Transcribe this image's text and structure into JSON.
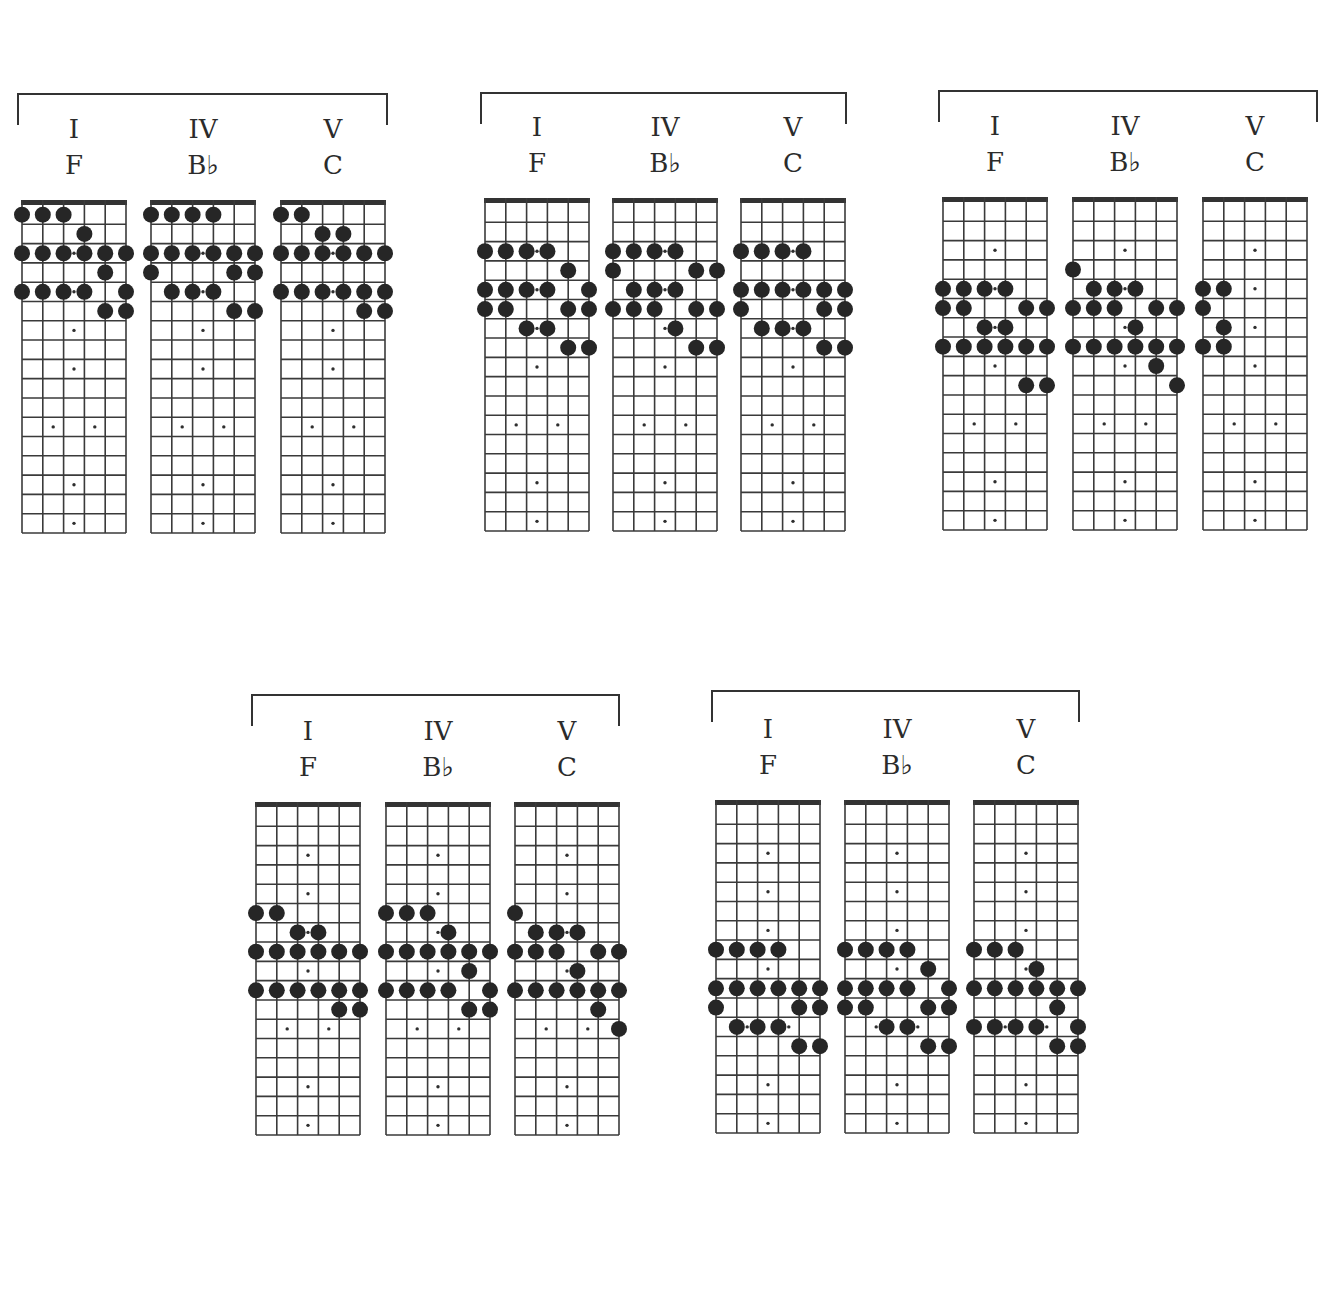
{
  "fretboard": {
    "strings": 6,
    "frets": 17,
    "inlays_single": [
      3,
      5,
      7,
      9,
      15,
      17
    ],
    "inlays_double": [
      12
    ]
  },
  "groups": [
    {
      "id": "g1",
      "x": 17,
      "y": 93,
      "w": 371,
      "boardTop": 200,
      "boardX": [
        22,
        151,
        281
      ],
      "chords": [
        {
          "numeral": "I",
          "name": "F",
          "dots": {
            "1": [
              1,
              2,
              3
            ],
            "2": [
              4
            ],
            "3": [
              1,
              2,
              3,
              4,
              5,
              6
            ],
            "4": [
              5
            ],
            "5": [
              1,
              2,
              3,
              4,
              6
            ],
            "6": [
              5,
              6
            ]
          }
        },
        {
          "numeral": "IV",
          "name": "B♭",
          "dots": {
            "1": [
              1,
              2,
              3,
              4
            ],
            "3": [
              1,
              2,
              3,
              4,
              5,
              6
            ],
            "4": [
              1,
              5,
              6
            ],
            "5": [
              2,
              3,
              4
            ],
            "6": [
              5,
              6
            ]
          }
        },
        {
          "numeral": "V",
          "name": "C",
          "dots": {
            "1": [
              1,
              2
            ],
            "2": [
              3,
              4
            ],
            "3": [
              1,
              2,
              3,
              4,
              5,
              6
            ],
            "5": [
              1,
              2,
              3,
              4,
              5,
              6
            ],
            "6": [
              5,
              6
            ]
          }
        }
      ]
    },
    {
      "id": "g2",
      "x": 480,
      "y": 92,
      "w": 367,
      "boardTop": 198,
      "boardX": [
        485,
        613,
        741
      ],
      "chords": [
        {
          "numeral": "I",
          "name": "F",
          "dots": {
            "3": [
              1,
              2,
              3,
              4
            ],
            "4": [
              5
            ],
            "5": [
              1,
              2,
              3,
              4,
              6
            ],
            "6": [
              1,
              2,
              5,
              6
            ],
            "7": [
              3,
              4
            ],
            "8": [
              5,
              6
            ]
          }
        },
        {
          "numeral": "IV",
          "name": "B♭",
          "dots": {
            "3": [
              1,
              2,
              3,
              4
            ],
            "4": [
              1,
              5,
              6
            ],
            "5": [
              2,
              3,
              4
            ],
            "6": [
              1,
              2,
              3,
              5,
              6
            ],
            "7": [
              4
            ],
            "8": [
              5,
              6
            ]
          }
        },
        {
          "numeral": "V",
          "name": "C",
          "dots": {
            "3": [
              1,
              2,
              3,
              4
            ],
            "5": [
              1,
              2,
              3,
              4,
              5,
              6
            ],
            "6": [
              1,
              5,
              6
            ],
            "7": [
              2,
              3,
              4
            ],
            "8": [
              5,
              6
            ]
          }
        }
      ]
    },
    {
      "id": "g3",
      "x": 938,
      "y": 90,
      "w": 380,
      "boardTop": 197,
      "boardX": [
        943,
        1073,
        1203
      ],
      "chords": [
        {
          "numeral": "I",
          "name": "F",
          "dots": {
            "5": [
              1,
              2,
              3,
              4
            ],
            "6": [
              1,
              2,
              5,
              6
            ],
            "7": [
              3,
              4
            ],
            "8": [
              1,
              2,
              3,
              4,
              5,
              6
            ],
            "10": [
              5,
              6
            ]
          }
        },
        {
          "numeral": "IV",
          "name": "B♭",
          "dots": {
            "4": [
              1
            ],
            "5": [
              2,
              3,
              4
            ],
            "6": [
              1,
              2,
              3,
              5,
              6
            ],
            "7": [
              4
            ],
            "8": [
              1,
              2,
              3,
              4,
              5,
              6
            ],
            "9": [
              5
            ],
            "10": [
              6
            ]
          }
        },
        {
          "numeral": "V",
          "name": "C",
          "dots": {
            "5": [
              1,
              2
            ],
            "6": [
              1
            ],
            "7": [
              2
            ],
            "8": [
              1,
              2
            ]
          }
        }
      ]
    },
    {
      "id": "g4",
      "x": 251,
      "y": 694,
      "w": 369,
      "boardTop": 802,
      "boardX": [
        256,
        386,
        515
      ],
      "chords": [
        {
          "numeral": "I",
          "name": "F",
          "dots": {
            "6": [
              1,
              2
            ],
            "7": [
              3,
              4
            ],
            "8": [
              1,
              2,
              3,
              4,
              5,
              6
            ],
            "10": [
              1,
              2,
              3,
              4,
              5,
              6
            ],
            "11": [
              5,
              6
            ]
          }
        },
        {
          "numeral": "IV",
          "name": "B♭",
          "dots": {
            "6": [
              1,
              2,
              3
            ],
            "7": [
              4
            ],
            "8": [
              1,
              2,
              3,
              4,
              5,
              6
            ],
            "9": [
              5
            ],
            "10": [
              1,
              2,
              3,
              4,
              6
            ],
            "11": [
              5,
              6
            ]
          }
        },
        {
          "numeral": "V",
          "name": "C",
          "dots": {
            "6": [
              1
            ],
            "7": [
              2,
              3,
              4
            ],
            "8": [
              1,
              2,
              3,
              5,
              6
            ],
            "9": [
              4
            ],
            "10": [
              1,
              2,
              3,
              4,
              5,
              6
            ],
            "11": [
              5
            ],
            "12": [
              6
            ]
          }
        }
      ]
    },
    {
      "id": "g5",
      "x": 711,
      "y": 690,
      "w": 369,
      "boardTop": 800,
      "boardX": [
        716,
        845,
        974
      ],
      "chords": [
        {
          "numeral": "I",
          "name": "F",
          "dots": {
            "8": [
              1,
              2,
              3,
              4
            ],
            "10": [
              1,
              2,
              3,
              4,
              5,
              6
            ],
            "11": [
              1,
              5,
              6
            ],
            "12": [
              2,
              3,
              4
            ],
            "13": [
              5,
              6
            ]
          }
        },
        {
          "numeral": "IV",
          "name": "B♭",
          "dots": {
            "8": [
              1,
              2,
              3,
              4
            ],
            "9": [
              5
            ],
            "10": [
              1,
              2,
              3,
              4,
              6
            ],
            "11": [
              1,
              2,
              5,
              6
            ],
            "12": [
              3,
              4
            ],
            "13": [
              5,
              6
            ]
          }
        },
        {
          "numeral": "V",
          "name": "C",
          "dots": {
            "8": [
              1,
              2,
              3
            ],
            "9": [
              4
            ],
            "10": [
              1,
              2,
              3,
              4,
              5,
              6
            ],
            "11": [
              5
            ],
            "12": [
              1,
              2,
              3,
              4,
              6
            ],
            "13": [
              5,
              6
            ]
          }
        }
      ]
    }
  ],
  "colors": {
    "ink": "#2e2e2e",
    "dot": "#262626",
    "grid": "#3a3a3a",
    "nut": "#333333",
    "paper": "#ffffff"
  }
}
